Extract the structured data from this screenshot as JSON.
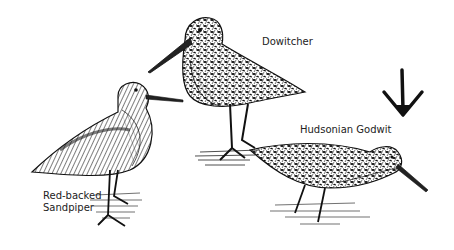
{
  "illustration": {
    "style": "black-and-white pen-and-ink drawing",
    "colors": {
      "ink": "#111111",
      "background": "#ffffff"
    },
    "birds": [
      {
        "id": "sandpiper",
        "label_line1": "Red-backed",
        "label_line2": "Sandpiper"
      },
      {
        "id": "dowitcher",
        "label": "Dowitcher"
      },
      {
        "id": "godwit",
        "label": "Hudsonian Godwit"
      }
    ],
    "footprint": {
      "icon": "bird-footprint-icon"
    }
  }
}
